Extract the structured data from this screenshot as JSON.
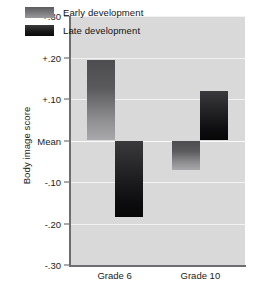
{
  "chart_data": {
    "type": "bar",
    "title": "",
    "xlabel": "",
    "ylabel": "Body image score",
    "categories": [
      "Grade 6",
      "Grade 10"
    ],
    "series": [
      {
        "name": "Early development",
        "values": [
          0.195,
          -0.07
        ]
      },
      {
        "name": "Late development",
        "values": [
          -0.185,
          0.12
        ]
      }
    ],
    "ylim": [
      -0.3,
      0.3
    ],
    "yticks": [
      0.3,
      0.2,
      0.1,
      0.0,
      -0.1,
      -0.2,
      -0.3
    ],
    "ytick_labels": [
      "+.30",
      "+.20",
      "+.10",
      "Mean",
      "-.10",
      "-.20",
      "-.30"
    ],
    "baseline_label": "Mean",
    "baseline_value": 0.0,
    "grid": true,
    "legend_position": "top-left-inside",
    "colors": {
      "panel_background": "#d9d9d9",
      "gridline": "#f2f2f2",
      "axis": "#6e6e70",
      "early_bar": "#6e6e70",
      "late_bar": "#17171a",
      "text": "#1b1b1b"
    }
  },
  "legend": {
    "items": [
      {
        "label": "Early development",
        "key": "early"
      },
      {
        "label": "Late development",
        "key": "late"
      }
    ]
  },
  "axis": {
    "y_title": "Body image score",
    "y_ticks": [
      {
        "label": "+.30",
        "value": 0.3
      },
      {
        "label": "+.20",
        "value": 0.2
      },
      {
        "label": "+.10",
        "value": 0.1
      },
      {
        "label": "Mean",
        "value": 0.0
      },
      {
        "label": "-.10",
        "value": -0.1
      },
      {
        "label": "-.20",
        "value": -0.2
      },
      {
        "label": "-.30",
        "value": -0.3
      }
    ],
    "x_ticks": [
      {
        "label": "Grade 6"
      },
      {
        "label": "Grade 10"
      }
    ]
  }
}
